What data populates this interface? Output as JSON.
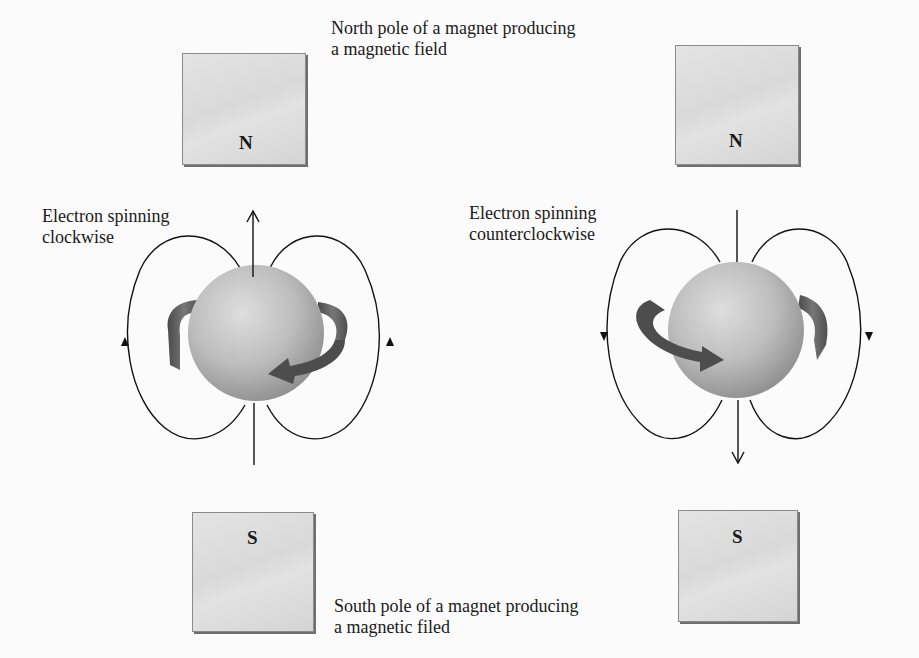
{
  "labels": {
    "north_caption_line1": "North pole of a magnet producing",
    "north_caption_line2": "a magnetic field",
    "south_caption_line1": "South pole of a magnet producing",
    "south_caption_line2": "a magnetic filed",
    "left_electron_line1": "Electron spinning",
    "left_electron_line2": "clockwise",
    "right_electron_line1": "Electron spinning",
    "right_electron_line2": "counterclockwise"
  },
  "magnets": {
    "left_top": {
      "pole": "N"
    },
    "right_top": {
      "pole": "N"
    },
    "left_bottom": {
      "pole": "S"
    },
    "right_bottom": {
      "pole": "S"
    }
  },
  "colors": {
    "magnet_fill": "#dcdcdc",
    "magnet_edge": "#6f6f6f",
    "field_line": "#111111",
    "sphere": "#b8b8b8",
    "spin_arrow": "#5a5a5a"
  }
}
